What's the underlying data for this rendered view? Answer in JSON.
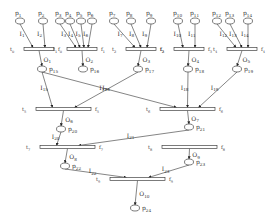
{
  "diagram": {
    "type": "petri-net",
    "places": [
      {
        "id": "p1",
        "label": "p1",
        "x": 20,
        "y": 21
      },
      {
        "id": "p2",
        "label": "p2",
        "x": 43,
        "y": 21
      },
      {
        "id": "p3",
        "label": "p3",
        "x": 60,
        "y": 21
      },
      {
        "id": "p4",
        "label": "p4",
        "x": 70,
        "y": 21
      },
      {
        "id": "p5",
        "label": "p5",
        "x": 81,
        "y": 21
      },
      {
        "id": "p6",
        "label": "p6",
        "x": 92,
        "y": 21
      },
      {
        "id": "p7",
        "label": "p7",
        "x": 114,
        "y": 21
      },
      {
        "id": "p8",
        "label": "p8",
        "x": 131,
        "y": 21
      },
      {
        "id": "p9",
        "label": "p9",
        "x": 151,
        "y": 21
      },
      {
        "id": "p10",
        "label": "p10",
        "x": 178,
        "y": 21
      },
      {
        "id": "p11",
        "label": "p11",
        "x": 195,
        "y": 21
      },
      {
        "id": "p12",
        "label": "p12",
        "x": 217,
        "y": 21
      },
      {
        "id": "p13",
        "label": "p13",
        "x": 230,
        "y": 21
      },
      {
        "id": "p14",
        "label": "p14",
        "x": 248,
        "y": 21
      },
      {
        "id": "p15",
        "label": "p15",
        "x": 42,
        "y": 69
      },
      {
        "id": "p16",
        "label": "p16",
        "x": 83,
        "y": 69
      },
      {
        "id": "p17",
        "label": "p17",
        "x": 138,
        "y": 69
      },
      {
        "id": "p18",
        "label": "p18",
        "x": 188,
        "y": 69
      },
      {
        "id": "p19",
        "label": "p19",
        "x": 237,
        "y": 69
      },
      {
        "id": "p20",
        "label": "p20",
        "x": 61,
        "y": 129
      },
      {
        "id": "p21",
        "label": "p21",
        "x": 189,
        "y": 127
      },
      {
        "id": "p22",
        "label": "p22",
        "x": 65,
        "y": 166
      },
      {
        "id": "p23",
        "label": "p23",
        "x": 189,
        "y": 162
      },
      {
        "id": "p24",
        "label": "p24",
        "x": 135,
        "y": 208
      }
    ],
    "transitions": [
      {
        "id": "t0",
        "left": "T0",
        "right": "F0",
        "x": 24,
        "y": 49,
        "w": 30
      },
      {
        "id": "t1",
        "left": "T1",
        "right": "F1",
        "x": 67,
        "y": 49,
        "w": 30
      },
      {
        "id": "t2",
        "left": "T2",
        "right": "F2",
        "x": 126,
        "y": 49,
        "w": 30
      },
      {
        "id": "t3",
        "left": "T3",
        "right": "F3",
        "x": 174,
        "y": 49,
        "w": 30
      },
      {
        "id": "t4",
        "left": "T4",
        "right": "F4",
        "x": 227,
        "y": 49,
        "w": 30
      },
      {
        "id": "t5",
        "left": "T5",
        "right": "F5",
        "x": 36,
        "y": 109,
        "w": 55
      },
      {
        "id": "t6",
        "left": "T6",
        "right": "F6",
        "x": 160,
        "y": 109,
        "w": 55
      },
      {
        "id": "t7",
        "left": "T7",
        "right": "F7",
        "x": 40,
        "y": 147,
        "w": 55
      },
      {
        "id": "t8",
        "left": "T8",
        "right": "F8",
        "x": 162,
        "y": 147,
        "w": 55
      },
      {
        "id": "t9",
        "left": "T9",
        "right": "F9",
        "x": 110,
        "y": 179,
        "w": 55
      }
    ],
    "input_arcs": [
      {
        "label": "I1",
        "from": "p1",
        "to": "t0"
      },
      {
        "label": "I2",
        "from": "p2",
        "to": "t0"
      },
      {
        "label": "I3",
        "from": "p3",
        "to": "t1"
      },
      {
        "label": "I4",
        "from": "p4",
        "to": "t1"
      },
      {
        "label": "I5",
        "from": "p5",
        "to": "t1"
      },
      {
        "label": "I6",
        "from": "p6",
        "to": "t1"
      },
      {
        "label": "I7",
        "from": "p7",
        "to": "t2"
      },
      {
        "label": "I8",
        "from": "p8",
        "to": "t2"
      },
      {
        "label": "I9",
        "from": "p9",
        "to": "t2"
      },
      {
        "label": "I10",
        "from": "p10",
        "to": "t3"
      },
      {
        "label": "I11",
        "from": "p11",
        "to": "t3"
      },
      {
        "label": "I12",
        "from": "p12",
        "to": "t4"
      },
      {
        "label": "I13",
        "from": "p13",
        "to": "t4"
      },
      {
        "label": "I14",
        "from": "p14",
        "to": "t4"
      },
      {
        "label": "I15",
        "from": "p15",
        "to": "t5"
      },
      {
        "label": "I16",
        "from": "p15",
        "to": "t6"
      },
      {
        "label": "I17",
        "from": "p17",
        "to": "t5"
      },
      {
        "label": "I18",
        "from": "p18",
        "to": "t6"
      },
      {
        "label": "I19",
        "from": "p19",
        "to": "t6"
      },
      {
        "label": "I20",
        "from": "p20",
        "to": "t7"
      },
      {
        "label": "I21",
        "from": "p21",
        "to": "t7"
      },
      {
        "label": "I22",
        "from": "p22",
        "to": "t9"
      },
      {
        "label": "I23",
        "from": "p23",
        "to": "t9"
      }
    ],
    "output_arcs": [
      {
        "label": "O1",
        "from": "t0",
        "to": "p15"
      },
      {
        "label": "O2",
        "from": "t1",
        "to": "p16"
      },
      {
        "label": "O3",
        "from": "t2",
        "to": "p17"
      },
      {
        "label": "O4",
        "from": "t3",
        "to": "p18"
      },
      {
        "label": "O5",
        "from": "t4",
        "to": "p19"
      },
      {
        "label": "O6",
        "from": "t5",
        "to": "p20"
      },
      {
        "label": "O7",
        "from": "t6",
        "to": "p21"
      },
      {
        "label": "O8",
        "from": "t7",
        "to": "p22"
      },
      {
        "label": "O9",
        "from": "t8",
        "to": "p23"
      },
      {
        "label": "O10",
        "from": "t9",
        "to": "p24"
      }
    ]
  }
}
